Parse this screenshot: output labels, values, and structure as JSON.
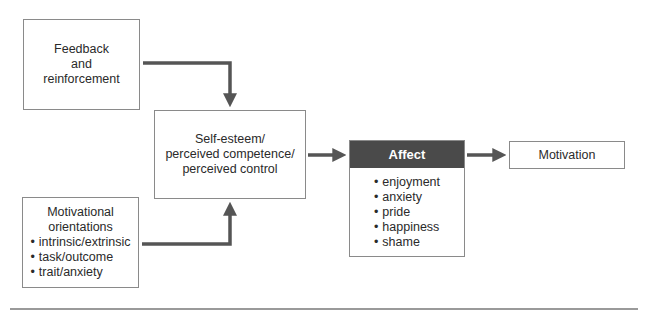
{
  "diagram": {
    "nodes": {
      "feedback": {
        "lines": [
          "Feedback",
          "and",
          "reinforcement"
        ]
      },
      "orientations": {
        "title_lines": [
          "Motivational",
          "orientations"
        ],
        "items": [
          "intrinsic/extrinsic",
          "task/outcome",
          "trait/anxiety"
        ]
      },
      "self_esteem": {
        "lines": [
          "Self-esteem/",
          "perceived competence/",
          "perceived control"
        ]
      },
      "affect": {
        "title": "Affect",
        "items": [
          "enjoyment",
          "anxiety",
          "pride",
          "happiness",
          "shame"
        ]
      },
      "motivation": {
        "label": "Motivation"
      }
    },
    "edges": [
      {
        "from": "Feedback and reinforcement",
        "to": "Self-esteem/perceived competence/perceived control"
      },
      {
        "from": "Motivational orientations",
        "to": "Self-esteem/perceived competence/perceived control"
      },
      {
        "from": "Self-esteem/perceived competence/perceived control",
        "to": "Affect"
      },
      {
        "from": "Affect",
        "to": "Motivation"
      }
    ],
    "colors": {
      "arrow": "#555555",
      "box_border": "#8a8a8a",
      "affect_header_bg": "#4a4a4a",
      "affect_header_text": "#ffffff"
    }
  }
}
